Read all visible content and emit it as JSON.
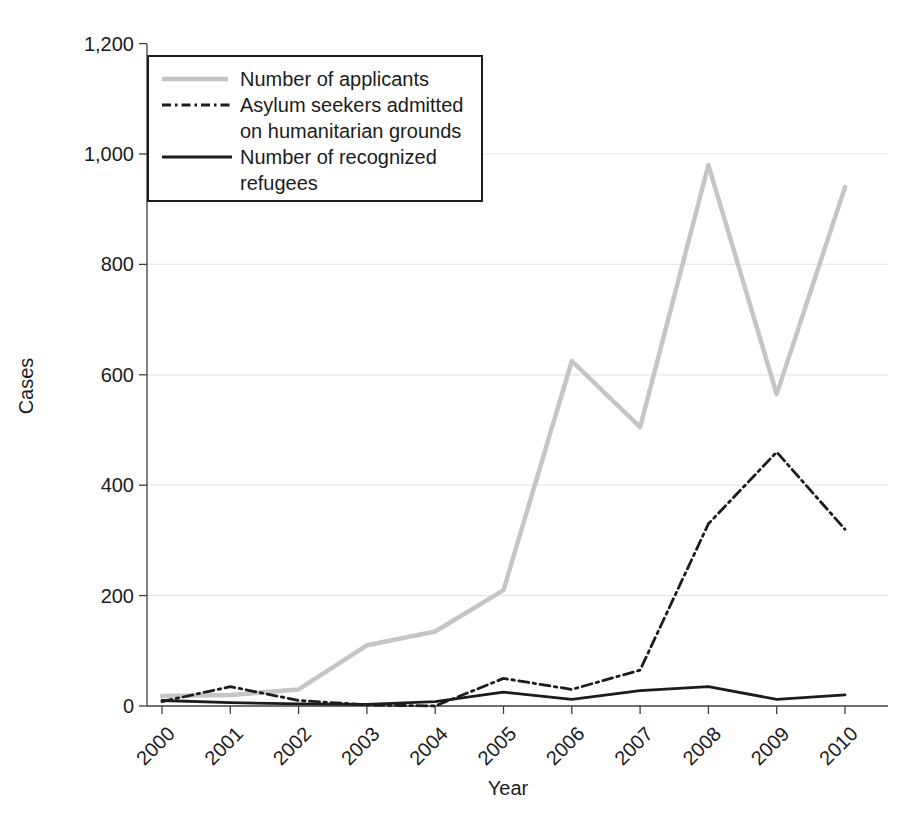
{
  "chart_data": {
    "type": "line",
    "x": [
      2000,
      2001,
      2002,
      2003,
      2004,
      2005,
      2006,
      2007,
      2008,
      2009,
      2010
    ],
    "x_tick_labels": [
      "2000",
      "2001",
      "2002",
      "2003",
      "2004",
      "2005",
      "2006",
      "2007",
      "2008",
      "2009",
      "2010"
    ],
    "series": [
      {
        "id": "applicants",
        "name": "Number of applicants",
        "values": [
          18,
          20,
          30,
          110,
          135,
          210,
          625,
          505,
          980,
          565,
          940
        ],
        "color": "#c5c5c5",
        "line_style": "solid",
        "line_width": 4.5
      },
      {
        "id": "humanitarian",
        "name": "Asylum seekers admitted on humanitarian grounds",
        "values": [
          8,
          35,
          10,
          2,
          0,
          50,
          30,
          65,
          330,
          460,
          320
        ],
        "color": "#1c1c1c",
        "line_style": "dash-dot",
        "line_width": 2.8
      },
      {
        "id": "refugees",
        "name": "Number of recognized refugees",
        "values": [
          10,
          6,
          4,
          3,
          8,
          25,
          12,
          28,
          35,
          12,
          20
        ],
        "color": "#1c1c1c",
        "line_style": "solid",
        "line_width": 2.8
      }
    ],
    "title": "",
    "xlabel": "Year",
    "ylabel": "Cases",
    "ylim": [
      0,
      1200
    ],
    "yticks": [
      0,
      200,
      400,
      600,
      800,
      1000,
      1200
    ],
    "y_tick_labels": [
      "0",
      "200",
      "400",
      "600",
      "800",
      "1,000",
      "1,200"
    ],
    "grid": true,
    "legend_position": "top-left"
  },
  "legend": {
    "entries": [
      {
        "label": "Number of applicants",
        "swatch": "gray-thick-line"
      },
      {
        "label": "Asylum seekers admitted\non humanitarian grounds",
        "swatch": "dash-dot-line"
      },
      {
        "label": "Number of recognized\nrefugees",
        "swatch": "solid-black-line"
      }
    ]
  },
  "colors": {
    "applicants_line": "#c5c5c5",
    "dark_line": "#1c1c1c",
    "gridline": "#e8e8e8",
    "axis": "#3f3f3f",
    "text": "#1c1c1c",
    "background": "#ffffff"
  }
}
